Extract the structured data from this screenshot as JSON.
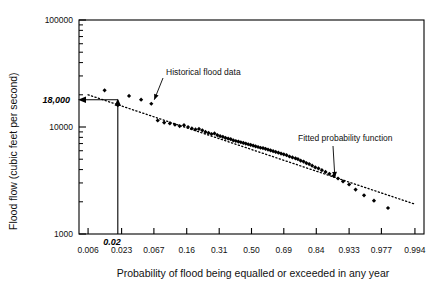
{
  "chart_data": {
    "type": "scatter",
    "title": "",
    "xlabel": "Probability of flood being equalled or exceeded in any year",
    "ylabel": "Flood flow (cubic feet per second)",
    "x_scale": "normal-probability",
    "y_scale": "log10",
    "xlim": [
      0.004,
      0.996
    ],
    "ylim": [
      1000,
      100000
    ],
    "grid": false,
    "legend": "none",
    "x_tick_labels": [
      "0.006",
      "0.023",
      "0.067",
      "0.16",
      "0.31",
      "0.50",
      "0.69",
      "0.84",
      "0.933",
      "0.977",
      "0.994"
    ],
    "x_tick_values": [
      0.006,
      0.023,
      0.067,
      0.16,
      0.31,
      0.5,
      0.69,
      0.84,
      0.933,
      0.977,
      0.994
    ],
    "y_tick_labels": [
      "1000",
      "10000",
      "100000"
    ],
    "y_tick_values": [
      1000,
      10000,
      100000
    ],
    "y_minor_ticks": [
      2000,
      3000,
      4000,
      5000,
      6000,
      7000,
      8000,
      9000,
      20000,
      30000,
      40000,
      50000,
      60000,
      70000,
      80000,
      90000
    ],
    "series": [
      {
        "name": "Historical flood data",
        "marker": "filled-diamond",
        "color": "#000000",
        "points": [
          [
            0.012,
            22000
          ],
          [
            0.02,
            16000
          ],
          [
            0.03,
            19500
          ],
          [
            0.045,
            18000
          ],
          [
            0.062,
            16500
          ],
          [
            0.075,
            11500
          ],
          [
            0.09,
            11000
          ],
          [
            0.105,
            10800
          ],
          [
            0.12,
            10500
          ],
          [
            0.135,
            10200
          ],
          [
            0.15,
            10400
          ],
          [
            0.165,
            10000
          ],
          [
            0.18,
            9700
          ],
          [
            0.195,
            9500
          ],
          [
            0.21,
            9600
          ],
          [
            0.225,
            9300
          ],
          [
            0.24,
            9000
          ],
          [
            0.255,
            8800
          ],
          [
            0.27,
            8600
          ],
          [
            0.285,
            8700
          ],
          [
            0.3,
            8400
          ],
          [
            0.315,
            8200
          ],
          [
            0.33,
            8100
          ],
          [
            0.345,
            7900
          ],
          [
            0.36,
            7800
          ],
          [
            0.375,
            7700
          ],
          [
            0.39,
            7500
          ],
          [
            0.405,
            7400
          ],
          [
            0.42,
            7300
          ],
          [
            0.435,
            7200
          ],
          [
            0.45,
            7100
          ],
          [
            0.465,
            7000
          ],
          [
            0.48,
            6900
          ],
          [
            0.495,
            6800
          ],
          [
            0.51,
            6700
          ],
          [
            0.525,
            6600
          ],
          [
            0.54,
            6500
          ],
          [
            0.555,
            6400
          ],
          [
            0.57,
            6350
          ],
          [
            0.585,
            6250
          ],
          [
            0.6,
            6150
          ],
          [
            0.615,
            6050
          ],
          [
            0.63,
            5950
          ],
          [
            0.645,
            5850
          ],
          [
            0.66,
            5750
          ],
          [
            0.675,
            5650
          ],
          [
            0.69,
            5550
          ],
          [
            0.705,
            5450
          ],
          [
            0.72,
            5300
          ],
          [
            0.735,
            5200
          ],
          [
            0.75,
            5100
          ],
          [
            0.762,
            5000
          ],
          [
            0.775,
            4850
          ],
          [
            0.788,
            4750
          ],
          [
            0.8,
            4600
          ],
          [
            0.812,
            4500
          ],
          [
            0.824,
            4350
          ],
          [
            0.836,
            4200
          ],
          [
            0.848,
            4100
          ],
          [
            0.86,
            3950
          ],
          [
            0.872,
            3800
          ],
          [
            0.884,
            3650
          ],
          [
            0.896,
            3500
          ],
          [
            0.908,
            3300
          ],
          [
            0.92,
            3100
          ],
          [
            0.933,
            2900
          ],
          [
            0.945,
            2600
          ],
          [
            0.958,
            2300
          ],
          [
            0.97,
            2050
          ],
          [
            0.982,
            1750
          ]
        ]
      }
    ],
    "fitted_line": {
      "name": "Fitted probability function",
      "style": "dotted",
      "color": "#000000",
      "endpoints": [
        [
          0.006,
          20000
        ],
        [
          0.994,
          1900
        ]
      ]
    },
    "construction_lines": {
      "probability": 0.02,
      "flow": 18000,
      "vertical_from": 1000,
      "vertical_to": 18000,
      "horizontal_arrow_to_axis": true
    },
    "annotations": [
      {
        "text": "Historical flood data",
        "points_to_x": 0.062,
        "points_to_y": 16500
      },
      {
        "text": "Fitted probability function",
        "points_to_x": 0.905,
        "points_to_y": 3100
      },
      {
        "text": "18,000",
        "axis": "y",
        "value": 18000,
        "emphasis": "bold-italic"
      },
      {
        "text": "0.02",
        "axis": "x",
        "value": 0.02,
        "emphasis": "bold-italic"
      }
    ]
  },
  "axes": {
    "x_title": "Probability of flood being equalled or exceeded in any year",
    "y_title": "Flood flow (cubic feet per second)",
    "x_ticks": [
      "0.006",
      "0.023",
      "0.067",
      "0.16",
      "0.31",
      "0.50",
      "0.69",
      "0.84",
      "0.933",
      "0.977",
      "0.994"
    ],
    "y_ticks": [
      "1000",
      "10000",
      "100000"
    ],
    "y_highlight_label": "18,000",
    "x_highlight_label": "0.02"
  },
  "annotations": {
    "data_label": "Historical flood data",
    "fit_label": "Fitted probability function"
  },
  "colors": {
    "axis": "#000000",
    "marker": "#000000",
    "fit": "#000000",
    "background": "#ffffff"
  }
}
